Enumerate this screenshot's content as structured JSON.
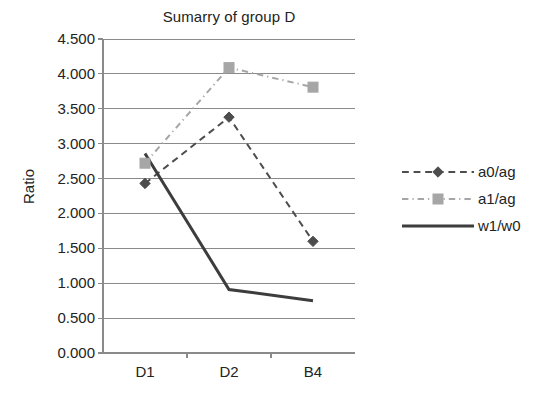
{
  "chart_data": {
    "type": "line",
    "title": "Sumarry of group D",
    "xlabel": "",
    "ylabel": "Ratio",
    "categories": [
      "D1",
      "D2",
      "B4"
    ],
    "ylim": [
      0.0,
      4.5
    ],
    "ytick_labels": [
      "0.000",
      "0.500",
      "1.000",
      "1.500",
      "2.000",
      "2.500",
      "3.000",
      "3.500",
      "4.000",
      "4.500"
    ],
    "ytick_values": [
      0.0,
      0.5,
      1.0,
      1.5,
      2.0,
      2.5,
      3.0,
      3.5,
      4.0,
      4.5
    ],
    "grid": true,
    "legend_position": "right",
    "series": [
      {
        "name": "a0/ag",
        "values": [
          2.43,
          3.38,
          1.6
        ],
        "color": "#4d4d4d",
        "marker": "diamond",
        "dash": "dashed"
      },
      {
        "name": "a1/ag",
        "values": [
          2.72,
          4.09,
          3.81
        ],
        "color": "#a6a6a6",
        "marker": "square",
        "dash": "dash-dot"
      },
      {
        "name": "w1/w0",
        "values": [
          2.86,
          0.91,
          0.75
        ],
        "color": "#3d3d3d",
        "marker": "none",
        "dash": "solid"
      }
    ]
  },
  "axis": {
    "line_color": "#8a8a8a",
    "grid_color": "#8a8a8a"
  }
}
